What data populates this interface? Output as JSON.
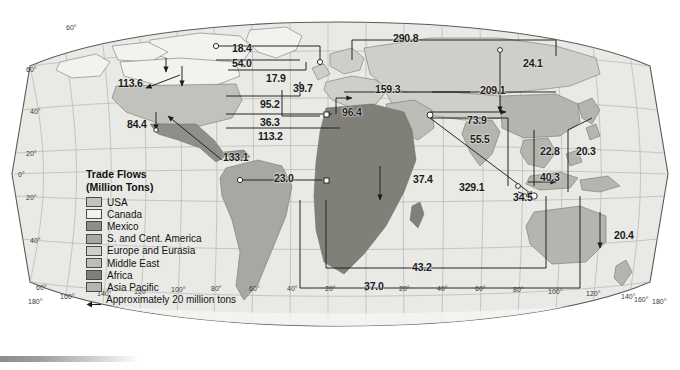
{
  "figure": {
    "kind": "world-map-flow-diagram",
    "background_color": "#ffffff",
    "ocean_color": "#e9e9e6",
    "graticule_color": "#b9b9b4",
    "outline_color": "#5a5a5a"
  },
  "legend": {
    "title_line1": "Trade Flows",
    "title_line2": "(Million Tons)",
    "items": [
      {
        "label": "USA",
        "color": "#c2c2bd"
      },
      {
        "label": "Canada",
        "color": "#f2f2ef"
      },
      {
        "label": "Mexico",
        "color": "#8f8f8a"
      },
      {
        "label": "S. and Cent. America",
        "color": "#a8a8a3"
      },
      {
        "label": "Europe and Eurasia",
        "color": "#cfcfca"
      },
      {
        "label": "Middle East",
        "color": "#bdbdb8"
      },
      {
        "label": "Africa",
        "color": "#808079"
      },
      {
        "label": "Asia Pacific",
        "color": "#b5b5b0"
      }
    ],
    "scale_note": "Approximately 20 million tons",
    "scale_icon": "left-arrow-icon"
  },
  "axes": {
    "latitude_labels": [
      "60°",
      "40°",
      "20°",
      "0°",
      "20°",
      "40°",
      "60°"
    ],
    "longitude_labels": [
      "180°",
      "160°",
      "140°",
      "120°",
      "100°",
      "80°",
      "60°",
      "40°",
      "20°",
      "0°",
      "20°",
      "40°",
      "60°",
      "80°",
      "100°",
      "120°",
      "140°",
      "160°",
      "180°"
    ],
    "top_label": "60°"
  },
  "chart_data": {
    "type": "map",
    "title": "Trade Flows (Million Tons)",
    "unit": "million tons",
    "scale_reference": "Approximately 20 million tons",
    "regions": [
      "USA",
      "Canada",
      "Mexico",
      "S. and Cent. America",
      "Europe and Eurasia",
      "Middle East",
      "Africa",
      "Asia Pacific"
    ],
    "flows": [
      {
        "value": "113.6",
        "x": 118,
        "y": 78
      },
      {
        "value": "84.4",
        "x": 127,
        "y": 119
      },
      {
        "value": "133.1",
        "x": 223,
        "y": 152
      },
      {
        "value": "18.4",
        "x": 232,
        "y": 43
      },
      {
        "value": "54.0",
        "x": 232,
        "y": 58
      },
      {
        "value": "17.9",
        "x": 266,
        "y": 73
      },
      {
        "value": "95.2",
        "x": 260,
        "y": 99
      },
      {
        "value": "36.3",
        "x": 260,
        "y": 117
      },
      {
        "value": "113.2",
        "x": 258,
        "y": 131
      },
      {
        "value": "23.0",
        "x": 274,
        "y": 173
      },
      {
        "value": "39.7",
        "x": 293,
        "y": 83
      },
      {
        "value": "96.4",
        "x": 342,
        "y": 107
      },
      {
        "value": "290.8",
        "x": 393,
        "y": 33
      },
      {
        "value": "159.3",
        "x": 375,
        "y": 84
      },
      {
        "value": "209.1",
        "x": 480,
        "y": 85
      },
      {
        "value": "24.1",
        "x": 523,
        "y": 58
      },
      {
        "value": "73.9",
        "x": 467,
        "y": 115
      },
      {
        "value": "55.5",
        "x": 470,
        "y": 134
      },
      {
        "value": "37.4",
        "x": 413,
        "y": 174
      },
      {
        "value": "329.1",
        "x": 459,
        "y": 182
      },
      {
        "value": "34.5",
        "x": 513,
        "y": 192
      },
      {
        "value": "40.3",
        "x": 540,
        "y": 172
      },
      {
        "value": "22.8",
        "x": 540,
        "y": 146
      },
      {
        "value": "20.3",
        "x": 576,
        "y": 146
      },
      {
        "value": "20.4",
        "x": 614,
        "y": 230
      },
      {
        "value": "43.2",
        "x": 412,
        "y": 262
      },
      {
        "value": "37.0",
        "x": 364,
        "y": 281
      }
    ]
  }
}
